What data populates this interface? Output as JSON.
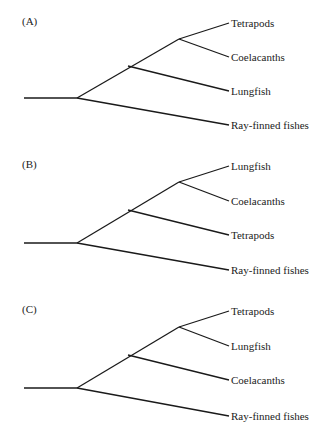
{
  "figure": {
    "panels": [
      {
        "label": "(A)",
        "tips": [
          "Tetrapods",
          "Coelacanths",
          "Lungfish",
          "Ray-finned fishes"
        ]
      },
      {
        "label": "(B)",
        "tips": [
          "Lungfish",
          "Coelacanths",
          "Tetrapods",
          "Ray-finned fishes"
        ]
      },
      {
        "label": "(C)",
        "tips": [
          "Tetrapods",
          "Lungfish",
          "Coelacanths",
          "Ray-finned fishes"
        ]
      }
    ],
    "line_color": "#1a1a1a"
  }
}
